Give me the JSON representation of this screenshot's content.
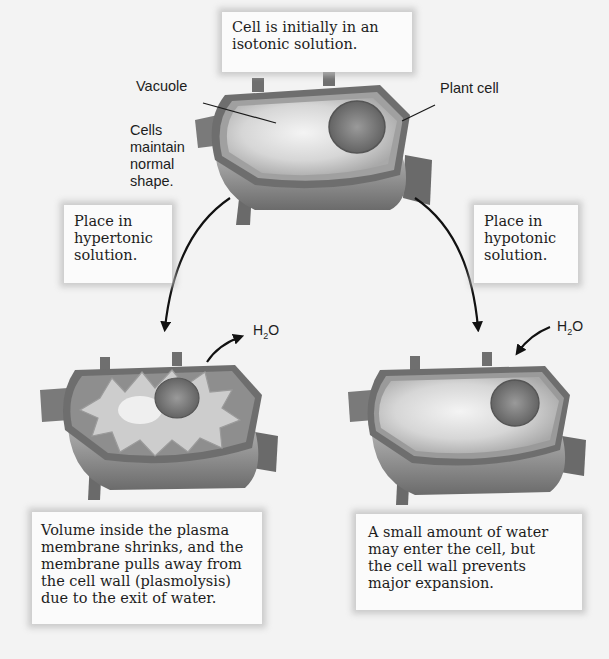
{
  "diagram": {
    "title_box": {
      "lines": [
        "Cell is initially in an",
        "isotonic solution."
      ]
    },
    "labels": {
      "vacuole": "Vacuole",
      "plant_cell": "Plant cell",
      "normal_shape": [
        "Cells",
        "maintain",
        "normal",
        "shape."
      ]
    },
    "hypertonic_box": {
      "lines": [
        "Place in",
        "hypertonic",
        "solution."
      ]
    },
    "hypotonic_box": {
      "lines": [
        "Place in",
        "hypotonic",
        "solution."
      ]
    },
    "water_label_left": {
      "h": "H",
      "sub": "2",
      "o": "O",
      "direction": "out"
    },
    "water_label_right": {
      "h": "H",
      "sub": "2",
      "o": "O",
      "direction": "in"
    },
    "plasmolysis_box": {
      "lines": [
        "Volume inside the plasma",
        "membrane shrinks, and the",
        "membrane pulls away from",
        "the cell wall (plasmolysis)",
        "due to the exit of water."
      ]
    },
    "turgid_box": {
      "lines": [
        "A small amount of water",
        "may enter the cell, but",
        "the cell wall prevents",
        "major expansion."
      ]
    },
    "colors": {
      "background": "#f3f3f3",
      "box_fill": "#fbfbfb",
      "wall_dark": "#5a5a5a",
      "wall_mid": "#8a8a8a",
      "cytoplasm": "#b8b8b8",
      "vacuole": "#e6e6e6",
      "nucleus": "#7d7d7d",
      "arrow": "#111111"
    }
  }
}
